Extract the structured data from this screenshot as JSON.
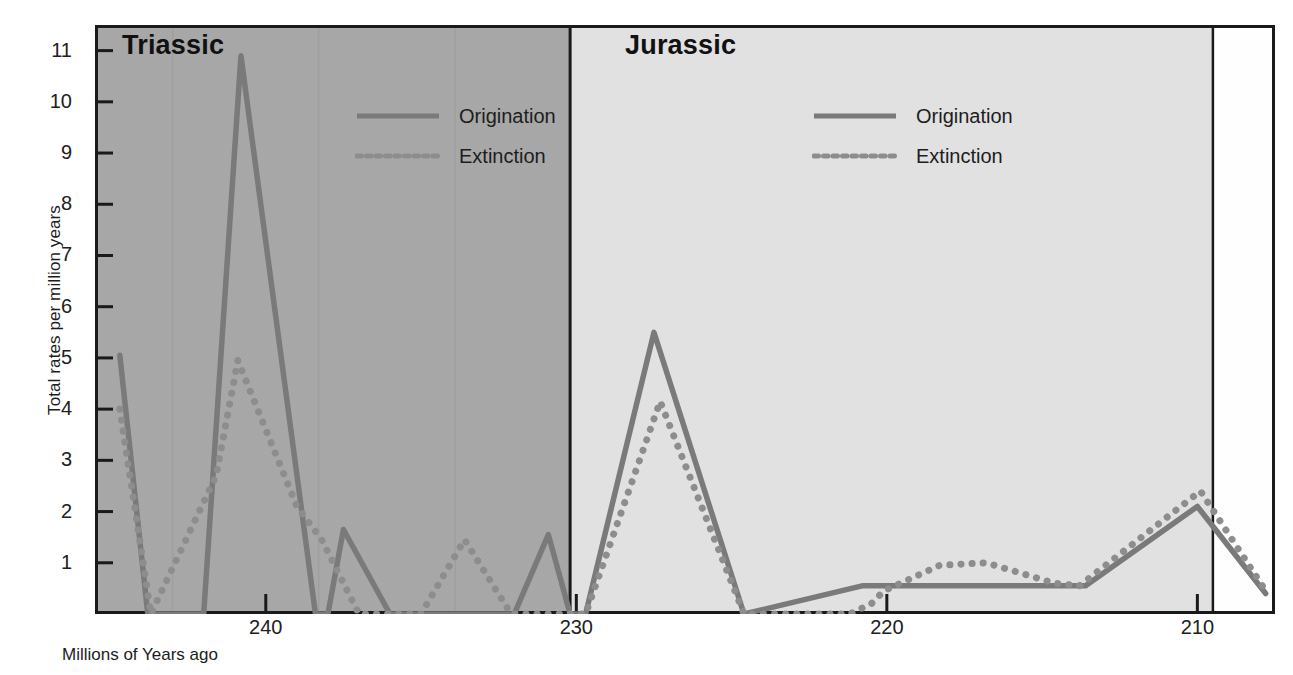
{
  "chart_data": {
    "type": "line",
    "title": "",
    "xlabel": "Millions of Years ago",
    "ylabel": "Total rates per million years",
    "xlim": [
      245.5,
      207.5
    ],
    "ylim": [
      0,
      11.5
    ],
    "x_ticks": [
      240,
      230,
      220,
      210
    ],
    "y_ticks": [
      1,
      2,
      3,
      4,
      5,
      6,
      7,
      8,
      9,
      10,
      11
    ],
    "grid": false,
    "axis_direction": "reversed",
    "legend_position": "inside-top-right-of-each-panel",
    "panels": [
      {
        "name": "Triassic",
        "label": "Triassic",
        "x_range": [
          245.5,
          230.2
        ],
        "background_color": "#a8a8a8"
      },
      {
        "name": "Jurassic",
        "label": "Jurassic",
        "x_range": [
          230.2,
          209.5
        ],
        "background_color": "#e2e2e2"
      }
    ],
    "series": [
      {
        "name": "Origination",
        "style": "solid",
        "color": "#7a7a7a",
        "points": [
          {
            "x": 244.7,
            "y": 5.05
          },
          {
            "x": 243.8,
            "y": 0.0
          },
          {
            "x": 242.0,
            "y": 0.0
          },
          {
            "x": 240.8,
            "y": 10.9
          },
          {
            "x": 238.4,
            "y": 0.0
          },
          {
            "x": 238.0,
            "y": 0.0
          },
          {
            "x": 237.5,
            "y": 1.65
          },
          {
            "x": 236.0,
            "y": 0.0
          },
          {
            "x": 232.0,
            "y": 0.0
          },
          {
            "x": 230.9,
            "y": 1.55
          },
          {
            "x": 230.2,
            "y": 0.0
          },
          {
            "x": 229.7,
            "y": 0.0
          },
          {
            "x": 227.5,
            "y": 5.5
          },
          {
            "x": 224.6,
            "y": 0.0
          },
          {
            "x": 220.8,
            "y": 0.55
          },
          {
            "x": 217.2,
            "y": 0.55
          },
          {
            "x": 214.1,
            "y": 0.55
          },
          {
            "x": 213.6,
            "y": 0.55
          },
          {
            "x": 210.0,
            "y": 2.1
          },
          {
            "x": 207.8,
            "y": 0.4
          }
        ]
      },
      {
        "name": "Extinction",
        "style": "dotted",
        "color": "#8d8d8d",
        "points": [
          {
            "x": 244.7,
            "y": 4.0
          },
          {
            "x": 243.7,
            "y": 0.0
          },
          {
            "x": 241.6,
            "y": 2.7
          },
          {
            "x": 240.9,
            "y": 4.95
          },
          {
            "x": 239.0,
            "y": 2.1
          },
          {
            "x": 238.2,
            "y": 1.45
          },
          {
            "x": 237.0,
            "y": 0.0
          },
          {
            "x": 235.0,
            "y": 0.0
          },
          {
            "x": 233.6,
            "y": 1.45
          },
          {
            "x": 232.1,
            "y": 0.0
          },
          {
            "x": 230.4,
            "y": 0.0
          },
          {
            "x": 229.7,
            "y": 0.0
          },
          {
            "x": 227.3,
            "y": 4.15
          },
          {
            "x": 224.6,
            "y": 0.0
          },
          {
            "x": 221.2,
            "y": 0.0
          },
          {
            "x": 220.5,
            "y": 0.2
          },
          {
            "x": 220.1,
            "y": 0.45
          },
          {
            "x": 218.3,
            "y": 0.95
          },
          {
            "x": 216.8,
            "y": 1.0
          },
          {
            "x": 214.6,
            "y": 0.6
          },
          {
            "x": 213.8,
            "y": 0.55
          },
          {
            "x": 209.9,
            "y": 2.4
          },
          {
            "x": 207.8,
            "y": 0.45
          }
        ]
      }
    ]
  },
  "axes": {
    "ylabel": "Total rates per million years",
    "xlabel": "Millions of Years ago",
    "y_ticks": [
      "11",
      "10",
      "9",
      "8",
      "7",
      "6",
      "5",
      "4",
      "3",
      "2",
      "1"
    ],
    "x_ticks": [
      "240",
      "230",
      "220",
      "210"
    ]
  },
  "panels": {
    "triassic": {
      "title": "Triassic",
      "legend": {
        "origination": "Origination",
        "extinction": "Extinction"
      }
    },
    "jurassic": {
      "title": "Jurassic",
      "legend": {
        "origination": "Origination",
        "extinction": "Extinction"
      }
    }
  },
  "colors": {
    "triassic_background": "#a8a8a8",
    "jurassic_background": "#e2e2e2",
    "line": "#7a7a7a",
    "axis": "#1a1a1a"
  }
}
